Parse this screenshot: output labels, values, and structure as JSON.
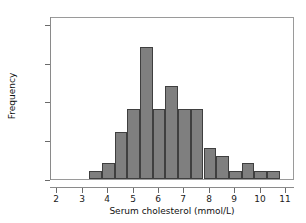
{
  "chart_data": {
    "type": "bar",
    "title": "",
    "subtitle": "",
    "xlabel": "Serum cholesterol (mmol/L)",
    "ylabel": "Frequency",
    "xlim": [
      1.75,
      11.35
    ],
    "ylim": [
      0,
      21
    ],
    "grid": false,
    "legend": null,
    "bin_width": 0.5,
    "bin_starts": [
      3.25,
      3.75,
      4.25,
      4.75,
      5.25,
      5.75,
      6.25,
      6.75,
      7.25,
      7.75,
      8.25,
      8.75,
      9.25,
      9.75,
      10.25
    ],
    "categories": [
      "3.25-3.75",
      "3.75-4.25",
      "4.25-4.75",
      "4.75-5.25",
      "5.25-5.75",
      "5.75-6.25",
      "6.25-6.75",
      "6.75-7.25",
      "7.25-7.75",
      "7.75-8.25",
      "8.25-8.75",
      "8.75-9.25",
      "9.25-9.75",
      "9.75-10.25",
      "10.25-10.75"
    ],
    "values": [
      1,
      2,
      6,
      9,
      17,
      9,
      12,
      9,
      9,
      4,
      3,
      1,
      2,
      1,
      1
    ],
    "xticks": [
      2,
      3,
      4,
      5,
      6,
      7,
      8,
      9,
      10,
      11
    ],
    "xtick_labels": [
      "2",
      "3",
      "4",
      "5",
      "6",
      "7",
      "8",
      "9",
      "10",
      "11"
    ],
    "yticks": [
      0,
      5,
      10,
      15,
      20
    ],
    "ytick_labels": [
      "0",
      "5",
      "10",
      "15",
      "20"
    ],
    "bar_color": "#7f7f7f",
    "bar_edge_color": "#3f3f3f",
    "axis_color": "#8a8a8a",
    "background_color": "#ffffff"
  }
}
